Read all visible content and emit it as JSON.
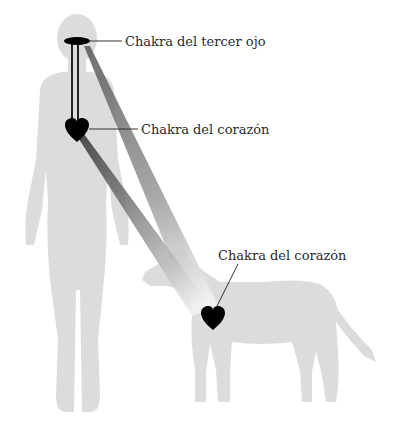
{
  "diagram": {
    "colors": {
      "silhouette": "#dcdcdc",
      "chakra": "#000000",
      "leader_line": "#333333",
      "beam_dark": "#6e6e6e",
      "beam_light": "#f2f2f2",
      "background": "#ffffff"
    },
    "figures": [
      "human-silhouette",
      "dog-silhouette"
    ],
    "labels": {
      "third_eye_human": "Chakra del tercer ojo",
      "heart_human": "Chakra del corazón",
      "heart_dog": "Chakra del corazón"
    }
  }
}
